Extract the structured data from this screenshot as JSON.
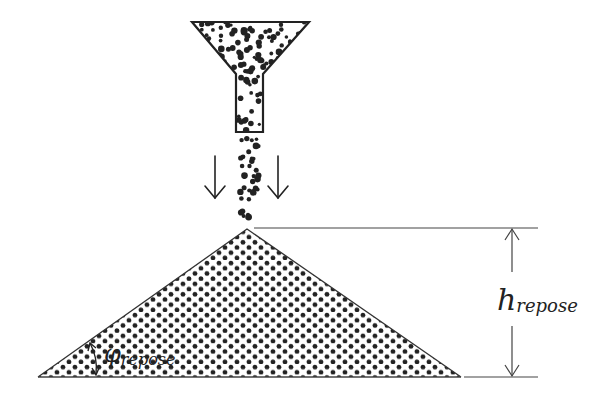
{
  "diagram": {
    "labels": {
      "height_symbol": "h",
      "height_subscript": "repose",
      "angle_symbol": "φ",
      "angle_subscript": "repose"
    },
    "components": [
      {
        "id": "funnel",
        "description": "Hopper funnel filled with granular particles"
      },
      {
        "id": "falling-stream",
        "description": "Stream of particles falling from the funnel"
      },
      {
        "id": "flow-arrow-left",
        "description": "Downward arrow indicating flow direction"
      },
      {
        "id": "flow-arrow-right",
        "description": "Downward arrow indicating flow direction"
      },
      {
        "id": "pile",
        "description": "Conical pile of granular material"
      },
      {
        "id": "height-dimension",
        "description": "Double-headed arrow measuring pile height"
      },
      {
        "id": "angle-marker",
        "description": "Arc arrow marking angle of repose at pile base"
      }
    ],
    "colors": {
      "ink": "#222222",
      "background": "#ffffff"
    }
  }
}
